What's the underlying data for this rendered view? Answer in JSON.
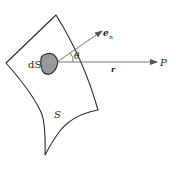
{
  "diagram": {
    "labels": {
      "area_element": "dS",
      "surface": "S",
      "normal_vector": "e",
      "normal_subscript": "n",
      "angle": "θ",
      "position_vector": "r",
      "point": "P"
    },
    "colors": {
      "stroke": "#2a2a2a",
      "arrow": "#555555",
      "patch_fill": "#9a9a9a",
      "background": "#ffffff"
    }
  }
}
